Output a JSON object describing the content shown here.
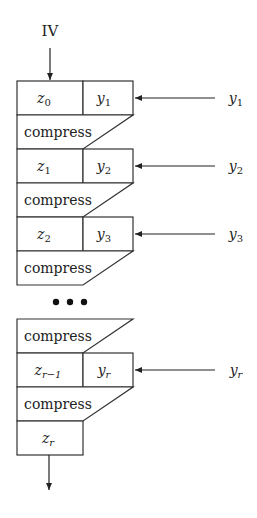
{
  "diagram": {
    "initial_input": "IV",
    "compress_label": "compress",
    "ellipsis": "•••",
    "stages": [
      {
        "z_base": "z",
        "z_sub": "0",
        "y_base": "y",
        "y_sub": "1",
        "input_label_base": "y",
        "input_label_sub": "1"
      },
      {
        "z_base": "z",
        "z_sub": "1",
        "y_base": "y",
        "y_sub": "2",
        "input_label_base": "y",
        "input_label_sub": "2"
      },
      {
        "z_base": "z",
        "z_sub": "2",
        "y_base": "y",
        "y_sub": "3",
        "input_label_base": "y",
        "input_label_sub": "3"
      },
      {
        "z_base": "z",
        "z_sub": "r−1",
        "y_base": "y",
        "y_sub": "r",
        "input_label_base": "y",
        "input_label_sub": "r"
      }
    ],
    "final_output": {
      "base": "z",
      "sub": "r"
    },
    "colors": {
      "stroke": "#333333",
      "text": "#222222",
      "background": "#ffffff"
    }
  }
}
